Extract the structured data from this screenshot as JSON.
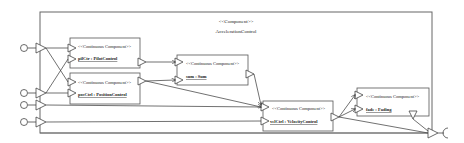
{
  "outer": {
    "stereotype": "<<Component>>",
    "name": "AccelerationControl"
  },
  "components": [
    {
      "id": "pilCtrl",
      "stereotype": "<<Continuous Component>>",
      "instance": "pilCtr",
      "type": "PilotControl"
    },
    {
      "id": "posCtrl",
      "stereotype": "<<Continuous Component>>",
      "instance": "posCtrl",
      "type": "PositionControl"
    },
    {
      "id": "sum",
      "stereotype": "<<Continuous Component>>",
      "instance": "sum",
      "type": "Sum"
    },
    {
      "id": "velCtrl",
      "stereotype": "<<Continuous Component>>",
      "instance": "velCtrl",
      "type": "VelocityControl"
    },
    {
      "id": "fade",
      "stereotype": "<<Continuous Component>>",
      "instance": "fade",
      "type": "Fading"
    }
  ],
  "labels": {
    "pil": "pilCtr : PilotControl",
    "pos": "posCtrl : PositionControl",
    "sum": "sum : Sum",
    "vel": "velCtrl : VelocityControl",
    "fade": "fade : Fading"
  },
  "colors": {
    "line": "#333333",
    "box": "#555555",
    "background": "#ffffff"
  }
}
